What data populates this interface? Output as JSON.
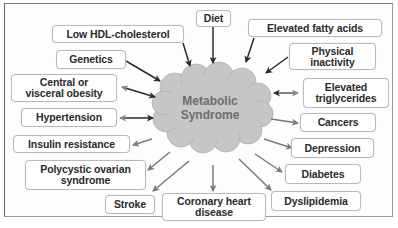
{
  "diagram": {
    "center": {
      "label": "Metabolic\nSyndrome",
      "fill": "#c4c4c4",
      "text_color": "#6d6d6d"
    },
    "causes": [
      {
        "id": "low-hdl",
        "label": "Low HDL-cholesterol",
        "arrow": "into-center",
        "arrow_color": "#2b2b2b"
      },
      {
        "id": "genetics",
        "label": "Genetics",
        "arrow": "into-center",
        "arrow_color": "#2b2b2b"
      },
      {
        "id": "diet",
        "label": "Diet",
        "arrow": "into-center",
        "arrow_color": "#2b2b2b"
      },
      {
        "id": "elevated-fatty-acids",
        "label": "Elevated fatty acids",
        "arrow": "into-center",
        "arrow_color": "#2b2b2b"
      },
      {
        "id": "physical-inactivity",
        "label": "Physical\ninactivity",
        "arrow": "into-center",
        "arrow_color": "#2b2b2b"
      }
    ],
    "bidirectional": [
      {
        "id": "central-obesity",
        "label": "Central or\nvisceral obesity",
        "arrow": "both"
      },
      {
        "id": "hypertension",
        "label": "Hypertension",
        "arrow": "both"
      },
      {
        "id": "elevated-triglycerides",
        "label": "Elevated\ntriglycerides",
        "arrow": "both"
      }
    ],
    "consequences": [
      {
        "id": "insulin-resistance",
        "label": "Insulin resistance",
        "arrow": "out-of-center",
        "arrow_color": "#7a7a7a"
      },
      {
        "id": "pcos",
        "label": "Polycystic ovarian\nsyndrome",
        "arrow": "out-of-center",
        "arrow_color": "#7a7a7a"
      },
      {
        "id": "stroke",
        "label": "Stroke",
        "arrow": "out-of-center",
        "arrow_color": "#7a7a7a"
      },
      {
        "id": "coronary-heart-disease",
        "label": "Coronary heart\ndisease",
        "arrow": "out-of-center",
        "arrow_color": "#7a7a7a"
      },
      {
        "id": "dyslipidemia",
        "label": "Dyslipidemia",
        "arrow": "out-of-center",
        "arrow_color": "#7a7a7a"
      },
      {
        "id": "diabetes",
        "label": "Diabetes",
        "arrow": "out-of-center",
        "arrow_color": "#7a7a7a"
      },
      {
        "id": "depression",
        "label": "Depression",
        "arrow": "out-of-center",
        "arrow_color": "#7a7a7a"
      },
      {
        "id": "cancers",
        "label": "Cancers",
        "arrow": "out-of-center",
        "arrow_color": "#7a7a7a"
      }
    ]
  }
}
